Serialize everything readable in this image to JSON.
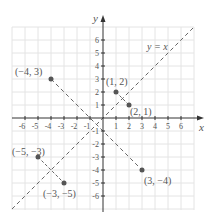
{
  "figure": {
    "axis_x_label": "x",
    "axis_y_label": "y",
    "line_label": "y = x",
    "x_ticks": [
      "-6",
      "-5",
      "-4",
      "-3",
      "-2",
      "-1",
      "1",
      "2",
      "3",
      "4",
      "5",
      "6"
    ],
    "y_ticks": [
      "6",
      "5",
      "4",
      "3",
      "2",
      "1",
      "-1",
      "-2",
      "-3",
      "-4",
      "-5",
      "-6"
    ],
    "points": [
      {
        "label": "(−4, 3)",
        "x": -4,
        "y": 3
      },
      {
        "label": "(1, 2)",
        "x": 1,
        "y": 2
      },
      {
        "label": "(2, 1)",
        "x": 2,
        "y": 1
      },
      {
        "label": "(3, −4)",
        "x": 3,
        "y": -4
      },
      {
        "label": "(−5, −3)",
        "x": -5,
        "y": -3
      },
      {
        "label": "(−3, −5)",
        "x": -3,
        "y": -5
      }
    ],
    "colors": {
      "grid": "#e4e4e4",
      "axis": "#333333",
      "point": "#555555",
      "dashed": "#666666",
      "text": "#555555"
    }
  }
}
